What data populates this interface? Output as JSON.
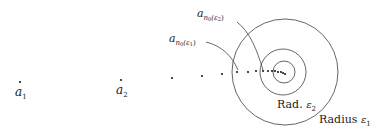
{
  "diagram": {
    "sequence_points": [
      {
        "x": 20,
        "y": 82
      },
      {
        "x": 121,
        "y": 80
      },
      {
        "x": 172,
        "y": 78
      },
      {
        "x": 202,
        "y": 76
      },
      {
        "x": 222,
        "y": 74
      },
      {
        "x": 237,
        "y": 72
      },
      {
        "x": 248,
        "y": 72
      },
      {
        "x": 256,
        "y": 71
      },
      {
        "x": 263,
        "y": 71
      },
      {
        "x": 268,
        "y": 71
      },
      {
        "x": 272,
        "y": 71
      },
      {
        "x": 275,
        "y": 71
      },
      {
        "x": 278,
        "y": 72
      },
      {
        "x": 281,
        "y": 72
      },
      {
        "x": 283,
        "y": 73
      },
      {
        "x": 285,
        "y": 74
      }
    ],
    "circles": [
      {
        "name": "radius-epsilon1",
        "cx": 285,
        "cy": 72,
        "r": 53
      },
      {
        "name": "radius-epsilon2",
        "cx": 283,
        "cy": 72,
        "r": 23
      },
      {
        "name": "inner",
        "cx": 284,
        "cy": 72,
        "r": 11
      }
    ],
    "labels": {
      "a1": {
        "base": "a",
        "sub": "1"
      },
      "a2": {
        "base": "a",
        "sub": "2"
      },
      "an0_eps1": {
        "base": "a",
        "sub": "n",
        "subsub": "0",
        "arg": "(ε",
        "argsub": "1",
        "close": ")"
      },
      "an0_eps2": {
        "base": "a",
        "sub": "n",
        "subsub": "0",
        "arg": "(ε",
        "argsub": "2",
        "close": ")"
      },
      "rad_eps2": {
        "text": "Rad. ",
        "sym": "ε",
        "sub": "2"
      },
      "radius_eps1": {
        "text": "Radius ",
        "sym": "ε",
        "sub": "1"
      }
    },
    "colors": {
      "ink": "#222222",
      "circle": "#555555"
    }
  }
}
